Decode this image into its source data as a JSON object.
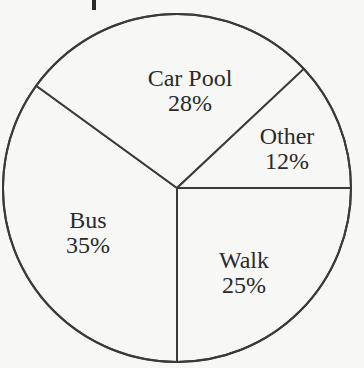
{
  "chart_data": {
    "type": "pie",
    "title": "",
    "start_angle_deg": 0,
    "direction": "clockwise",
    "categories": [
      "Walk",
      "Bus",
      "Car Pool",
      "Other"
    ],
    "values": [
      25,
      35,
      28,
      12
    ],
    "labels": [
      "25%",
      "35%",
      "28%",
      "12%"
    ],
    "unit": "%",
    "legend": "none (labels inside slices)",
    "colors": {
      "fill": "#f7f7f5",
      "stroke": "#3a3a3a"
    }
  },
  "labels": {
    "walk": {
      "name": "Walk",
      "pct": "25%"
    },
    "bus": {
      "name": "Bus",
      "pct": "35%"
    },
    "carpool": {
      "name": "Car Pool",
      "pct": "28%"
    },
    "other": {
      "name": "Other",
      "pct": "12%"
    }
  }
}
